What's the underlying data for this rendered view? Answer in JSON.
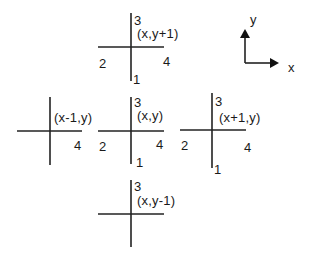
{
  "diagram": {
    "type": "neighboring-cell-edge-numbering",
    "axes": {
      "x_label": "x",
      "y_label": "y"
    },
    "cells": [
      {
        "id": "top",
        "coord": "(x,y+1)",
        "edges": {
          "bottom": "1",
          "left": "2",
          "top": "3",
          "right": "4"
        }
      },
      {
        "id": "left",
        "coord": "(x-1,y)",
        "edges": {
          "right": "4"
        }
      },
      {
        "id": "center",
        "coord": "(x,y)",
        "edges": {
          "bottom": "1",
          "left": "2",
          "top": "3",
          "right": "4"
        }
      },
      {
        "id": "right",
        "coord": "(x+1,y)",
        "edges": {
          "bottom": "1",
          "left": "2",
          "top": "3",
          "right": "4"
        }
      },
      {
        "id": "bottom",
        "coord": "(x,y-1)",
        "edges": {
          "top": "3"
        }
      }
    ]
  },
  "line_color": "#222222"
}
